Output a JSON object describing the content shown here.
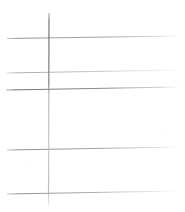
{
  "document": {
    "kind": "scanned-ruled-lines",
    "title": "Ruled line scan",
    "background_color": "#ffffff",
    "width": 185,
    "height": 212
  },
  "chart_data": {
    "type": "line",
    "title": "",
    "xlabel": "",
    "ylabel": "",
    "xlim": [
      0,
      185
    ],
    "ylim": [
      0,
      212
    ],
    "grid": false,
    "legend_position": "none",
    "categories": [],
    "series": [
      {
        "name": "horizontal-rule-1",
        "orientation": "horizontal",
        "x": [
          7,
          178
        ],
        "y": [
          38.5,
          36.0
        ],
        "color": "#9a9a9a",
        "stroke_width": 1.1,
        "opacity": 0.85
      },
      {
        "name": "horizontal-rule-2",
        "orientation": "horizontal",
        "x": [
          7,
          178
        ],
        "y": [
          73.0,
          70.0
        ],
        "color": "#a9a9a9",
        "stroke_width": 1.0,
        "opacity": 0.75
      },
      {
        "name": "horizontal-rule-3",
        "orientation": "horizontal",
        "x": [
          6,
          178
        ],
        "y": [
          90.0,
          87.0
        ],
        "color": "#848484",
        "stroke_width": 1.2,
        "opacity": 0.95
      },
      {
        "name": "horizontal-rule-4",
        "orientation": "horizontal",
        "x": [
          7,
          178
        ],
        "y": [
          150.0,
          147.0
        ],
        "color": "#949494",
        "stroke_width": 1.1,
        "opacity": 0.85
      },
      {
        "name": "horizontal-rule-5",
        "orientation": "horizontal",
        "x": [
          7,
          178
        ],
        "y": [
          194.0,
          191.0
        ],
        "color": "#969696",
        "stroke_width": 1.1,
        "opacity": 0.85
      },
      {
        "name": "vertical-rule-1",
        "orientation": "vertical",
        "x": [
          49.0,
          48.5
        ],
        "y": [
          13,
          206
        ],
        "color": "#8e8e8e",
        "stroke_width": 1.2,
        "opacity": 0.9
      }
    ],
    "annotations": []
  },
  "strokes": {
    "horizontal": [
      {
        "id": "h1",
        "label": "Horizontal line 1",
        "x1": 7,
        "y1": 38.5,
        "x2": 178,
        "y2": 36.0,
        "color": "#9a9a9a",
        "width": 1.1,
        "fade_right": true
      },
      {
        "id": "h2",
        "label": "Horizontal line 2",
        "x1": 7,
        "y1": 73.0,
        "x2": 178,
        "y2": 70.0,
        "color": "#a9a9a9",
        "width": 1.0,
        "fade_right": true
      },
      {
        "id": "h3",
        "label": "Horizontal line 3",
        "x1": 6,
        "y1": 90.0,
        "x2": 178,
        "y2": 87.0,
        "color": "#848484",
        "width": 1.2,
        "fade_right": true
      },
      {
        "id": "h4",
        "label": "Horizontal line 4",
        "x1": 7,
        "y1": 150.0,
        "x2": 178,
        "y2": 147.0,
        "color": "#949494",
        "width": 1.1,
        "fade_right": true
      },
      {
        "id": "h5",
        "label": "Horizontal line 5",
        "x1": 7,
        "y1": 194.0,
        "x2": 178,
        "y2": 191.0,
        "color": "#969696",
        "width": 1.1,
        "fade_right": true
      }
    ],
    "vertical": [
      {
        "id": "v1",
        "label": "Vertical line 1",
        "x1": 49.0,
        "y1": 13,
        "x2": 48.5,
        "y2": 206,
        "color_top": "#7c7c7c",
        "color_bottom": "#b2b2b2",
        "width": 1.2
      }
    ]
  },
  "colors": {
    "background": "#ffffff",
    "ink_dark": "#7c7c7c",
    "ink_mid": "#949494",
    "ink_light": "#b2b2b2"
  }
}
